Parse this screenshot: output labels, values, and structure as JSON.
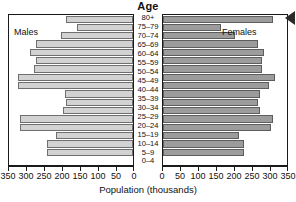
{
  "chart_data": {
    "type": "bar",
    "subtype": "population-pyramid",
    "title": "Age",
    "xlabel": "Population (thousands)",
    "ylabel": "Age",
    "grid": false,
    "legend_position": "inside-panels",
    "categories": [
      "0–4",
      "5–9",
      "10–14",
      "15–19",
      "20–24",
      "25–29",
      "30–34",
      "35–39",
      "40–44",
      "45–49",
      "50–54",
      "55–59",
      "60–64",
      "65–69",
      "70–74",
      "75–79",
      "80+"
    ],
    "xlim_left": [
      350,
      0
    ],
    "xlim_right": [
      0,
      350
    ],
    "xticks_left": [
      "350",
      "300",
      "250",
      "200",
      "150",
      "100",
      "50",
      "0"
    ],
    "xticks_right": [
      "0",
      "50",
      "100",
      "150",
      "200",
      "250",
      "300",
      "350"
    ],
    "xtick_values_left": [
      350,
      300,
      250,
      200,
      150,
      100,
      50,
      0
    ],
    "xtick_values_right": [
      0,
      50,
      100,
      150,
      200,
      250,
      300,
      350
    ],
    "series": [
      {
        "name": "Males",
        "side": "left",
        "color": "#d2d2d2",
        "values": [
          240,
          240,
          215,
          315,
          315,
          195,
          185,
          190,
          320,
          320,
          275,
          270,
          285,
          270,
          200,
          155,
          185
        ]
      },
      {
        "name": "Females",
        "side": "right",
        "color": "#9c9c9c",
        "values": [
          225,
          225,
          210,
          300,
          305,
          270,
          265,
          270,
          295,
          310,
          275,
          275,
          280,
          265,
          200,
          160,
          305
        ]
      }
    ]
  },
  "labels": {
    "males": "Males",
    "females": "Females"
  },
  "marker": {
    "arrow": "left-pointing-triangle"
  }
}
